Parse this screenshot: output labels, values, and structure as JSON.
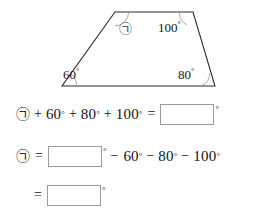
{
  "figure": {
    "shape_name": "trapezoid",
    "unknown_symbol": "㉠",
    "angles": [
      {
        "id": "angle-unknown",
        "label": "㉠",
        "position": "top-left",
        "is_unknown": true
      },
      {
        "id": "angle-top-right",
        "label": "100",
        "degree_mark": "°",
        "position": "top-right",
        "is_unknown": false
      },
      {
        "id": "angle-bottom-right",
        "label": "80",
        "degree_mark": "°",
        "position": "bottom-right",
        "is_unknown": false
      },
      {
        "id": "angle-bottom-left",
        "label": "60",
        "degree_mark": "°",
        "position": "bottom-left",
        "is_unknown": false
      }
    ],
    "vertices": {
      "top_left": [
        115,
        12
      ],
      "top_right": [
        193,
        12
      ],
      "bottom_right": [
        215,
        86
      ],
      "bottom_left": [
        62,
        86
      ]
    },
    "stroke_color": "#2b2b2b",
    "arc_color": "#9e9e9e"
  },
  "equations": [
    {
      "id": "equation-1",
      "tokens": [
        {
          "type": "symbol",
          "text": "㉠"
        },
        {
          "type": "operator",
          "text": "+"
        },
        {
          "type": "number",
          "text": "60",
          "degree": "°"
        },
        {
          "type": "operator",
          "text": "+"
        },
        {
          "type": "number",
          "text": "80",
          "degree": "°"
        },
        {
          "type": "operator",
          "text": "+"
        },
        {
          "type": "number",
          "text": "100",
          "degree": "°"
        },
        {
          "type": "operator",
          "text": "="
        },
        {
          "type": "blank",
          "value": "",
          "degree": "°"
        }
      ]
    },
    {
      "id": "equation-2",
      "tokens": [
        {
          "type": "symbol",
          "text": "㉠"
        },
        {
          "type": "operator",
          "text": "="
        },
        {
          "type": "blank",
          "value": "",
          "degree": "°"
        },
        {
          "type": "operator",
          "text": "−"
        },
        {
          "type": "number",
          "text": "60",
          "degree": "°"
        },
        {
          "type": "operator",
          "text": "−"
        },
        {
          "type": "number",
          "text": "80",
          "degree": "°"
        },
        {
          "type": "operator",
          "text": "−"
        },
        {
          "type": "number",
          "text": "100",
          "degree": "°"
        }
      ]
    },
    {
      "id": "equation-3",
      "tokens": [
        {
          "type": "operator",
          "text": "="
        },
        {
          "type": "blank",
          "value": "",
          "degree": "°"
        }
      ]
    }
  ],
  "labels": {
    "deg": "°",
    "plus": "+",
    "minus": "−",
    "equals": "=",
    "sym": "㉠",
    "n60": "60",
    "n80": "80",
    "n100": "100",
    "blank_value": ""
  }
}
